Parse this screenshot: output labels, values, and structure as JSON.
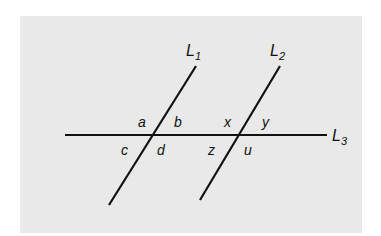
{
  "diagram": {
    "type": "parallel lines cut by a transversal",
    "colors": {
      "background": "#e9e9e9",
      "line": "#111111"
    },
    "lines": {
      "L1": {
        "name": "L",
        "sub": "1"
      },
      "L2": {
        "name": "L",
        "sub": "2"
      },
      "L3": {
        "name": "L",
        "sub": "3"
      }
    },
    "angles": {
      "a": "a",
      "b": "b",
      "c": "c",
      "d": "d",
      "x": "x",
      "y": "y",
      "z": "z",
      "u": "u"
    }
  }
}
